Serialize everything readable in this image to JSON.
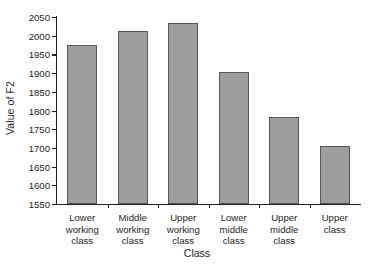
{
  "chart_data": {
    "type": "bar",
    "title": "",
    "subtitle": "",
    "xlabel": "Class",
    "ylabel": "Value of F2",
    "categories": [
      "Lower working class",
      "Middle working class",
      "Upper working class",
      "Lower middle class",
      "Upper middle class",
      "Upper class"
    ],
    "category_lines": [
      [
        "Lower",
        "working",
        "class"
      ],
      [
        "Middle",
        "working",
        "class"
      ],
      [
        "Upper",
        "working",
        "class"
      ],
      [
        "Lower",
        "middle",
        "class"
      ],
      [
        "Upper",
        "middle",
        "class"
      ],
      [
        "Upper",
        "class"
      ]
    ],
    "values": [
      1975,
      2013,
      2035,
      1903,
      1783,
      1705
    ],
    "ylim": [
      1550,
      2050
    ],
    "ytick_labels": [
      "1550",
      "1600",
      "1650",
      "1700",
      "1750",
      "1800",
      "1850",
      "1900",
      "1950",
      "2000",
      "2050"
    ],
    "ytick_values": [
      1550,
      1600,
      1650,
      1700,
      1750,
      1800,
      1850,
      1900,
      1950,
      2000,
      2050
    ],
    "grid": false,
    "legend": false,
    "legend_position": "none",
    "bar_color": "#9d9d9d",
    "bar_border_color": "#58585a",
    "axis_color": "#231f20",
    "background_color": "#ffffff"
  }
}
